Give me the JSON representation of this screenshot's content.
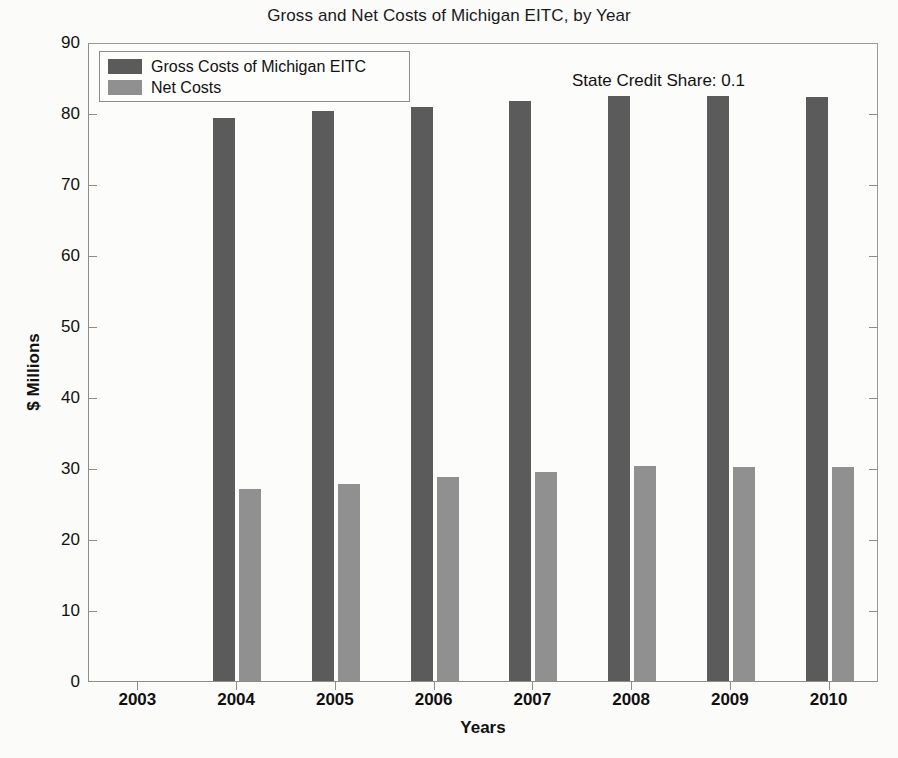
{
  "chart_data": {
    "type": "bar",
    "title": "Gross and Net Costs of Michigan EITC, by Year",
    "xlabel": "Years",
    "ylabel": "$ Millions",
    "categories": [
      "2003",
      "2004",
      "2005",
      "2006",
      "2007",
      "2008",
      "2009",
      "2010"
    ],
    "series": [
      {
        "name": "Gross Costs of Michigan EITC",
        "color": "#5b5b5b",
        "values": [
          0,
          79.3,
          80.3,
          80.9,
          81.7,
          82.4,
          82.4,
          82.3
        ]
      },
      {
        "name": "Net Costs",
        "color": "#909090",
        "values": [
          0,
          27.0,
          27.8,
          28.7,
          29.5,
          30.3,
          30.2,
          30.1
        ]
      }
    ],
    "ylim": [
      0,
      90
    ],
    "yticks": [
      0,
      10,
      20,
      30,
      40,
      50,
      60,
      70,
      80,
      90
    ],
    "ytick_labels": [
      "0",
      "10",
      "20",
      "30",
      "40",
      "50",
      "60",
      "70",
      "80",
      "90"
    ],
    "grid": false,
    "legend_position": "upper-left",
    "annotations": [
      {
        "text": "State Credit Share: 0.1"
      }
    ]
  },
  "legend": {
    "entries": [
      {
        "label": "Gross Costs of Michigan EITC"
      },
      {
        "label": "Net Costs"
      }
    ]
  }
}
